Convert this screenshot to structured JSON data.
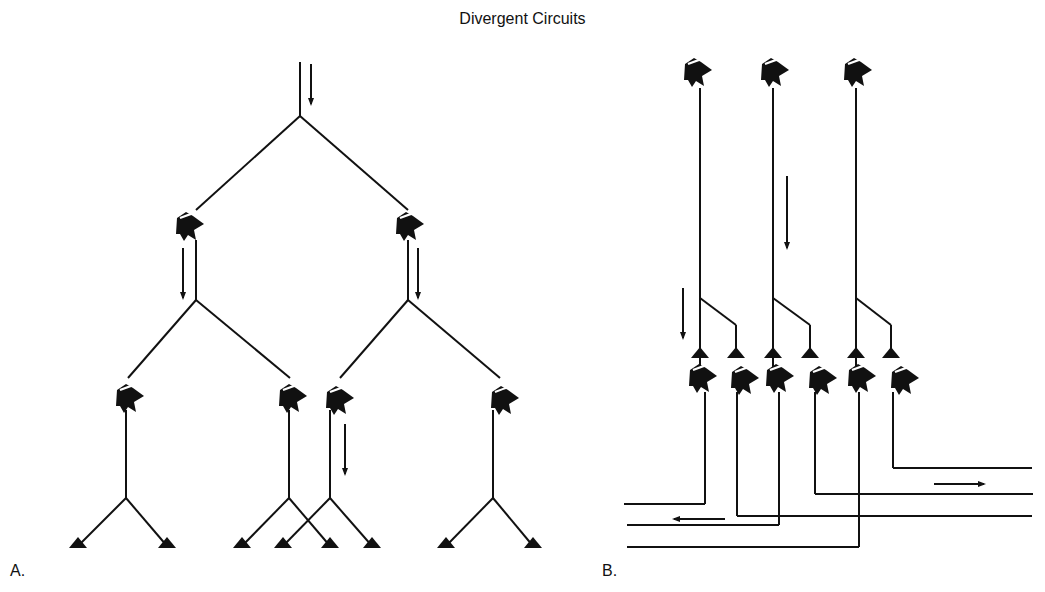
{
  "title": "Divergent Circuits",
  "panels": {
    "a": {
      "label": "A."
    },
    "b": {
      "label": "B."
    }
  },
  "colors": {
    "ink": "#111111",
    "paper": "#ffffff"
  },
  "diagram": {
    "a": {
      "lines": [
        [
          300,
          62,
          300,
          116
        ],
        [
          300,
          116,
          196,
          210
        ],
        [
          300,
          116,
          408,
          210
        ],
        [
          196,
          240,
          196,
          300
        ],
        [
          408,
          240,
          408,
          300
        ],
        [
          196,
          300,
          128,
          378
        ],
        [
          196,
          300,
          290,
          378
        ],
        [
          408,
          300,
          340,
          378
        ],
        [
          408,
          300,
          500,
          378
        ],
        [
          126,
          410,
          126,
          498
        ],
        [
          289,
          410,
          289,
          498
        ],
        [
          330,
          410,
          330,
          498
        ],
        [
          493,
          410,
          493,
          498
        ],
        [
          126,
          498,
          78,
          546
        ],
        [
          126,
          498,
          167,
          546
        ],
        [
          289,
          498,
          242,
          546
        ],
        [
          289,
          498,
          330,
          546
        ],
        [
          330,
          498,
          283,
          546
        ],
        [
          330,
          498,
          372,
          546
        ],
        [
          493,
          498,
          446,
          546
        ],
        [
          493,
          498,
          533,
          546
        ]
      ],
      "somas": [
        [
          190,
          226
        ],
        [
          410,
          226
        ],
        [
          130,
          398
        ],
        [
          293,
          398
        ],
        [
          340,
          400
        ],
        [
          505,
          400
        ]
      ],
      "terminals": [
        [
          78,
          546
        ],
        [
          167,
          546
        ],
        [
          242,
          546
        ],
        [
          283,
          546
        ],
        [
          330,
          546
        ],
        [
          372,
          546
        ],
        [
          446,
          546
        ],
        [
          533,
          546
        ]
      ],
      "arrows": [
        [
          311,
          64,
          311,
          104
        ],
        [
          183,
          248,
          183,
          298
        ],
        [
          418,
          248,
          418,
          298
        ],
        [
          345,
          424,
          345,
          474
        ]
      ]
    },
    "b": {
      "lines": [
        [
          700,
          88,
          700,
          368
        ],
        [
          773,
          88,
          773,
          368
        ],
        [
          856,
          88,
          856,
          368
        ],
        [
          700,
          298,
          736,
          325
        ],
        [
          736,
          325,
          736,
          356
        ],
        [
          773,
          298,
          810,
          325
        ],
        [
          810,
          325,
          810,
          356
        ],
        [
          856,
          298,
          891,
          325
        ],
        [
          891,
          325,
          891,
          356
        ],
        [
          705,
          392,
          705,
          504
        ],
        [
          624,
          504,
          705,
          504
        ],
        [
          737,
          392,
          737,
          516
        ],
        [
          737,
          516,
          1032,
          516
        ],
        [
          779,
          392,
          779,
          525
        ],
        [
          627,
          525,
          779,
          525
        ],
        [
          815,
          392,
          815,
          494
        ],
        [
          815,
          494,
          1033,
          494
        ],
        [
          859,
          392,
          859,
          547
        ],
        [
          627,
          547,
          859,
          547
        ],
        [
          893,
          392,
          893,
          468
        ],
        [
          893,
          468,
          1032,
          468
        ]
      ],
      "somas": [
        [
          698,
          72
        ],
        [
          775,
          72
        ],
        [
          858,
          72
        ],
        [
          703,
          378
        ],
        [
          745,
          380
        ],
        [
          780,
          378
        ],
        [
          823,
          380
        ],
        [
          862,
          378
        ],
        [
          905,
          380
        ]
      ],
      "terminals": [
        [
          700,
          356
        ],
        [
          736,
          356
        ],
        [
          773,
          356
        ],
        [
          810,
          356
        ],
        [
          856,
          356
        ],
        [
          891,
          356
        ]
      ],
      "arrows": [
        [
          787,
          176,
          787,
          248
        ],
        [
          683,
          288,
          683,
          338
        ],
        [
          934,
          484,
          984,
          484
        ],
        [
          725,
          519,
          674,
          519
        ]
      ]
    }
  }
}
